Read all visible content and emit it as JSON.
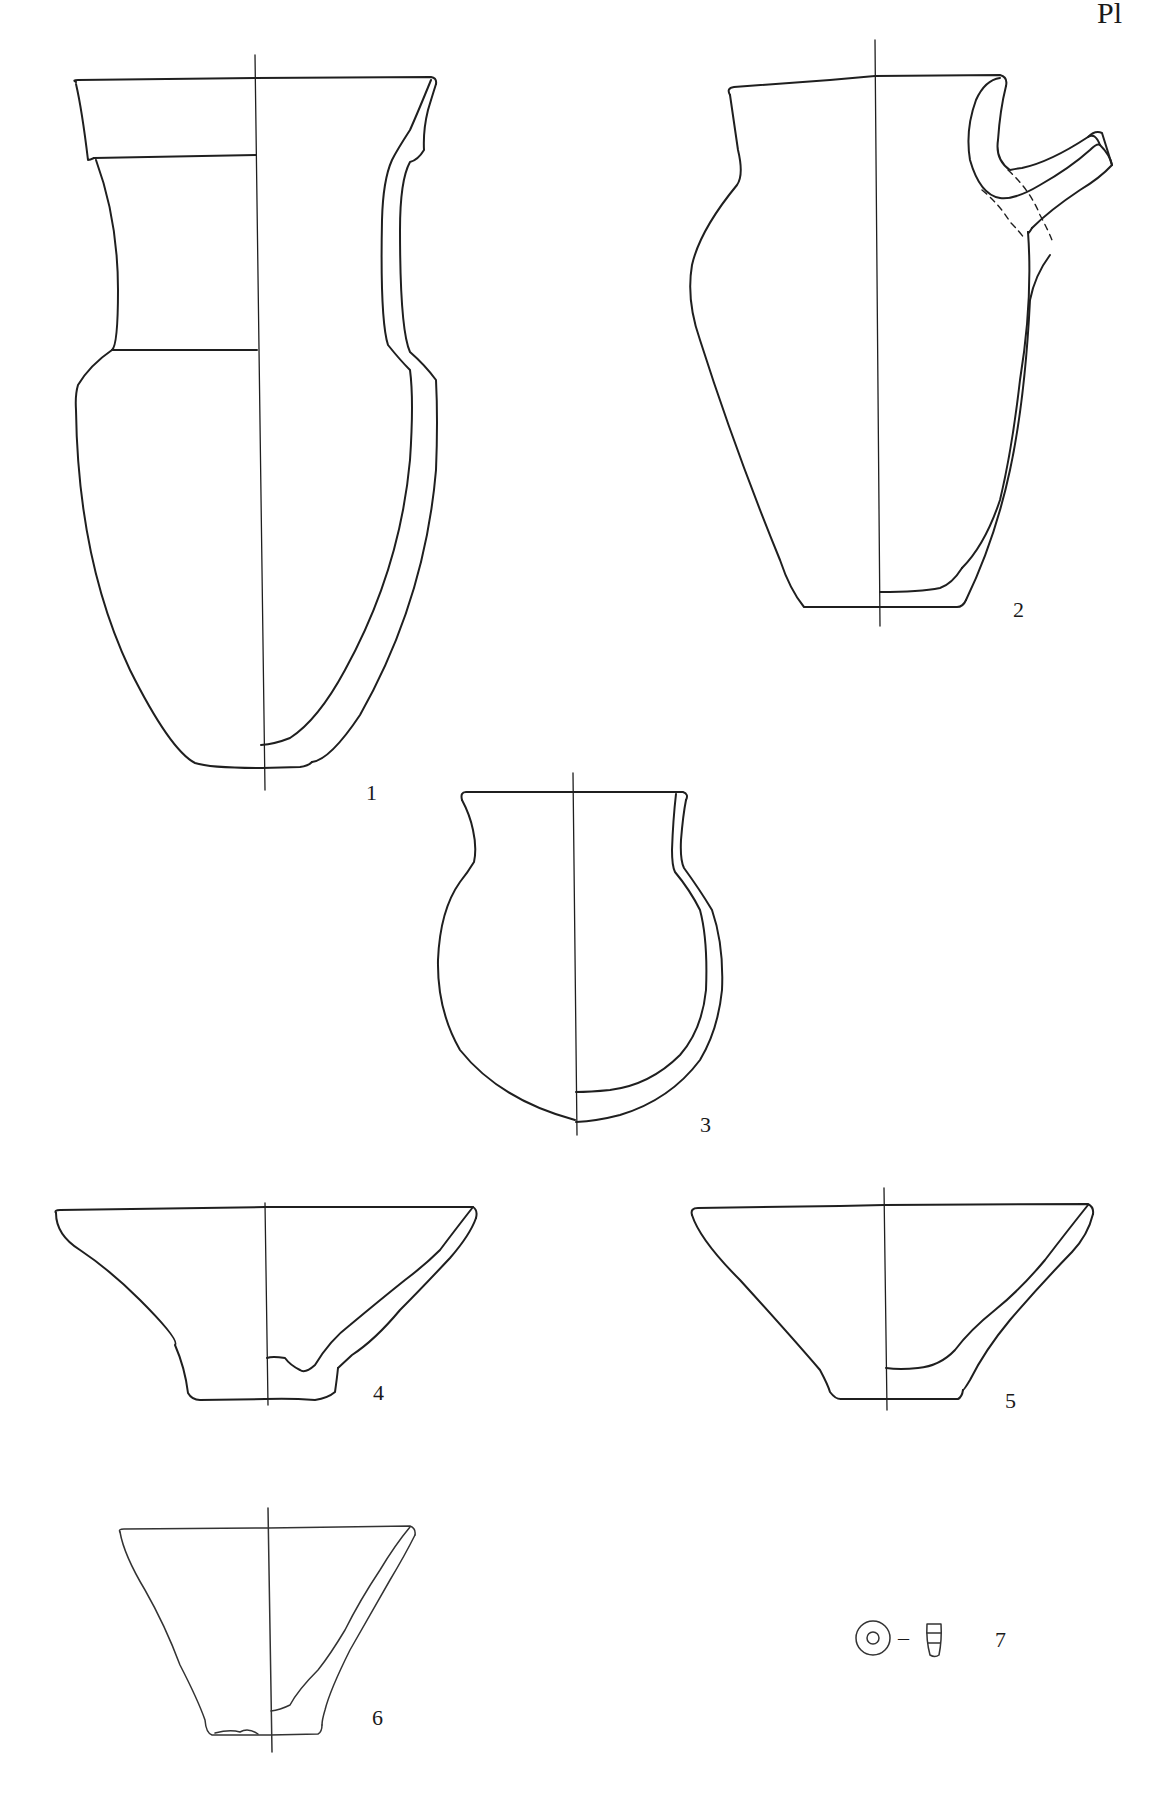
{
  "plate": {
    "header": "Pl",
    "background": "#ffffff",
    "line_color": "#1f1f1f"
  },
  "figures": [
    {
      "number": "1",
      "object": "tall-flared-neck-jar"
    },
    {
      "number": "2",
      "object": "spouted-jar-with-handle"
    },
    {
      "number": "3",
      "object": "round-bodied-jar"
    },
    {
      "number": "4",
      "object": "conical-bowl"
    },
    {
      "number": "5",
      "object": "conical-bowl"
    },
    {
      "number": "6",
      "object": "conical-cup"
    },
    {
      "number": "7",
      "object": "spindle-whorl-bead",
      "separator": "–"
    }
  ]
}
